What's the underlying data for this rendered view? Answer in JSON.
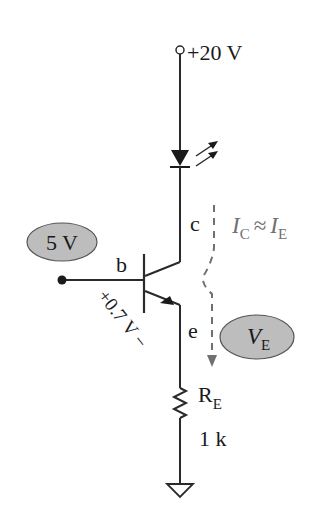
{
  "diagram": {
    "type": "circuit-schematic",
    "title": "",
    "supply": {
      "label": "+20 V"
    },
    "led": {
      "name": "LED",
      "emits_light": true
    },
    "transistor": {
      "type": "NPN BJT",
      "terminals": {
        "collector": "c",
        "base": "b",
        "emitter": "e"
      },
      "vbe_label": "+0.7 V −"
    },
    "base_input": {
      "label": "5 V"
    },
    "current_annotation": {
      "ic": "I",
      "ic_sub": "C",
      "approx": "≈",
      "ie": "I",
      "ie_sub": "E"
    },
    "emitter_voltage": {
      "label": "V",
      "sub": "E"
    },
    "resistor": {
      "name": "R",
      "sub": "E",
      "value": "1 k"
    },
    "ground": {
      "name": "ground"
    },
    "colors": {
      "wire": "#2a2a2a",
      "bubble_fill": "#bdbdbd",
      "bubble_stroke": "#555555",
      "annotation": "#707070"
    }
  }
}
